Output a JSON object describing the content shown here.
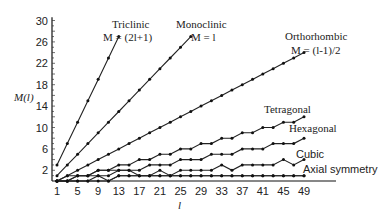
{
  "chart_data": {
    "type": "line",
    "title": "",
    "xlabel": "l",
    "ylabel": "M(l)",
    "xlim": [
      0,
      55
    ],
    "ylim": [
      0,
      31
    ],
    "x_ticks": [
      1,
      5,
      9,
      13,
      17,
      21,
      25,
      29,
      33,
      37,
      41,
      45,
      49
    ],
    "y_ticks": [
      2,
      6,
      10,
      14,
      18,
      22,
      26,
      30
    ],
    "grid": false,
    "legend_position": "inline labels",
    "series": [
      {
        "name": "Triclinic",
        "formula": "M = (2l+1)",
        "x": [
          1,
          3,
          5,
          7,
          9,
          11,
          13
        ],
        "values": [
          3,
          7,
          11,
          15,
          19,
          23,
          27
        ]
      },
      {
        "name": "Monoclinic",
        "formula": "M = l",
        "x": [
          1,
          3,
          5,
          7,
          9,
          11,
          13,
          15,
          17,
          19,
          21,
          23,
          25,
          27
        ],
        "values": [
          1,
          3,
          5,
          7,
          9,
          11,
          13,
          15,
          17,
          19,
          21,
          23,
          25,
          27
        ]
      },
      {
        "name": "Orthorhombic",
        "formula": "M = (l-1)/2",
        "x": [
          1,
          3,
          5,
          7,
          9,
          11,
          13,
          15,
          17,
          19,
          21,
          23,
          25,
          27,
          29,
          31,
          33,
          35,
          37,
          39,
          41,
          43,
          45,
          47,
          49
        ],
        "values": [
          0,
          1,
          2,
          3,
          4,
          5,
          6,
          7,
          8,
          9,
          10,
          11,
          12,
          13,
          14,
          15,
          16,
          17,
          18,
          19,
          20,
          21,
          22,
          23,
          24
        ]
      },
      {
        "name": "Tetragonal",
        "formula": "",
        "x": [
          1,
          3,
          5,
          7,
          9,
          11,
          13,
          15,
          17,
          19,
          21,
          23,
          25,
          27,
          29,
          31,
          33,
          35,
          37,
          39,
          41,
          43,
          45,
          47,
          49
        ],
        "values": [
          0,
          1,
          1,
          1,
          2,
          2,
          3,
          3,
          4,
          4,
          5,
          5,
          6,
          6,
          7,
          7,
          8,
          8,
          9,
          9,
          10,
          10,
          11,
          11,
          12
        ]
      },
      {
        "name": "Hexagonal",
        "formula": "",
        "x": [
          1,
          3,
          5,
          7,
          9,
          11,
          13,
          15,
          17,
          19,
          21,
          23,
          25,
          27,
          29,
          31,
          33,
          35,
          37,
          39,
          41,
          43,
          45,
          47,
          49
        ],
        "values": [
          0,
          0,
          1,
          1,
          2,
          2,
          2,
          2,
          2,
          3,
          3,
          3,
          4,
          4,
          4,
          5,
          5,
          5,
          6,
          6,
          6,
          7,
          7,
          7,
          8
        ]
      },
      {
        "name": "Cubic",
        "formula": "",
        "x": [
          1,
          3,
          5,
          7,
          9,
          11,
          13,
          15,
          17,
          19,
          21,
          23,
          25,
          27,
          29,
          31,
          33,
          35,
          37,
          39,
          41,
          43,
          45,
          47,
          49
        ],
        "values": [
          0,
          0,
          0,
          0,
          1,
          0,
          1,
          1,
          1,
          1,
          2,
          1,
          2,
          2,
          2,
          2,
          3,
          2,
          3,
          3,
          3,
          3,
          4,
          3,
          4
        ]
      },
      {
        "name": "Axial symmetry",
        "formula": "",
        "x": [
          1,
          3,
          5,
          7,
          9,
          11,
          13,
          15,
          17,
          19,
          21,
          23,
          25,
          27,
          29,
          31,
          33,
          35,
          37,
          39,
          41,
          43,
          45,
          47,
          49
        ],
        "values": [
          0,
          0,
          1,
          1,
          1,
          1,
          2,
          2,
          1,
          1,
          1,
          1,
          1,
          1,
          1,
          1,
          1,
          1,
          1,
          1,
          1,
          1,
          1,
          1,
          1
        ]
      },
      {
        "name": "Axial symmetry (lower)",
        "formula": "",
        "x": [
          1,
          3,
          5,
          7,
          9,
          11,
          13,
          15,
          17,
          19,
          21,
          23,
          25,
          27,
          29,
          31,
          33,
          35,
          37,
          39,
          41,
          43,
          45,
          47,
          49
        ],
        "values": [
          0,
          0,
          0,
          0,
          0,
          0,
          1,
          1,
          1,
          1,
          1,
          1,
          1,
          1,
          1,
          1,
          1,
          1,
          1,
          1,
          1,
          1,
          1,
          1,
          1
        ]
      }
    ],
    "annotations": [
      {
        "text": "Triclinic",
        "sub": "M = (2l+1)"
      },
      {
        "text": "Monoclinic",
        "sub": "M = l"
      },
      {
        "text": "Orthorhombic",
        "sub": "M = (l-1)/2"
      },
      {
        "text": "Tetragonal"
      },
      {
        "text": "Hexagonal"
      },
      {
        "text": "Cubic"
      },
      {
        "text": "Axial symmetry"
      }
    ]
  },
  "labels": {
    "ylabel": "M(l)",
    "xlabel": "l",
    "triclinic": "Triclinic",
    "triclinic_formula": "M = (2l+1)",
    "monoclinic": "Monoclinic",
    "monoclinic_formula": "M = l",
    "orthorhombic": "Orthorhombic",
    "orthorhombic_formula": "M = (l-1)/2",
    "tetragonal": "Tetragonal",
    "hexagonal": "Hexagonal",
    "cubic": "Cubic",
    "axial": "Axial symmetry"
  }
}
